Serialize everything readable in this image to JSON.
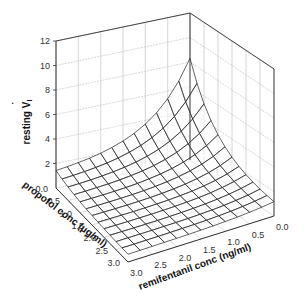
{
  "chart_data": {
    "type": "surface3d",
    "title": "",
    "zlabel": "resting V̇I",
    "zlabel_main": "resting V",
    "zlabel_dot": "˙",
    "zlabel_sub": "I",
    "xlabel": "propofol conc (µg/ml)",
    "ylabel": "remifentanil conc (ng/ml)",
    "z_ticks": [
      "2",
      "4",
      "6",
      "8",
      "10",
      "12"
    ],
    "z_tick_values": [
      2,
      4,
      6,
      8,
      10,
      12
    ],
    "zlim": [
      0,
      12
    ],
    "propofol_ticks": [
      "0.0",
      "0.5",
      "1.0",
      "1.5",
      "2.0",
      "2.5",
      "3.0"
    ],
    "remifentanil_ticks": [
      "0.0",
      "0.5",
      "1.0",
      "1.5",
      "2.0",
      "2.5",
      "3.0"
    ],
    "propofol_range": [
      0,
      3.0
    ],
    "remifentanil_range": [
      0,
      3.0
    ],
    "grid": true,
    "surface_grid_steps": 12,
    "surface_description": "Resting ventilation surface peaking (~8.3) at zero propofol and zero remifentanil, falling steeply with either drug, approaching ~1 at high concentrations of both.",
    "peak_value": 8.3,
    "edge_values": {
      "propofol_0_remi_0": 8.3,
      "propofol_3_remi_0": 2.0,
      "propofol_0_remi_3": 2.2,
      "propofol_3_remi_3": 0.6
    },
    "front_left_edge_at_propofol_0_remi_3": 5.2,
    "colors": {
      "line": "#222222",
      "grid": "#bbbbbb",
      "axis": "#333333",
      "background": "#ffffff"
    }
  }
}
